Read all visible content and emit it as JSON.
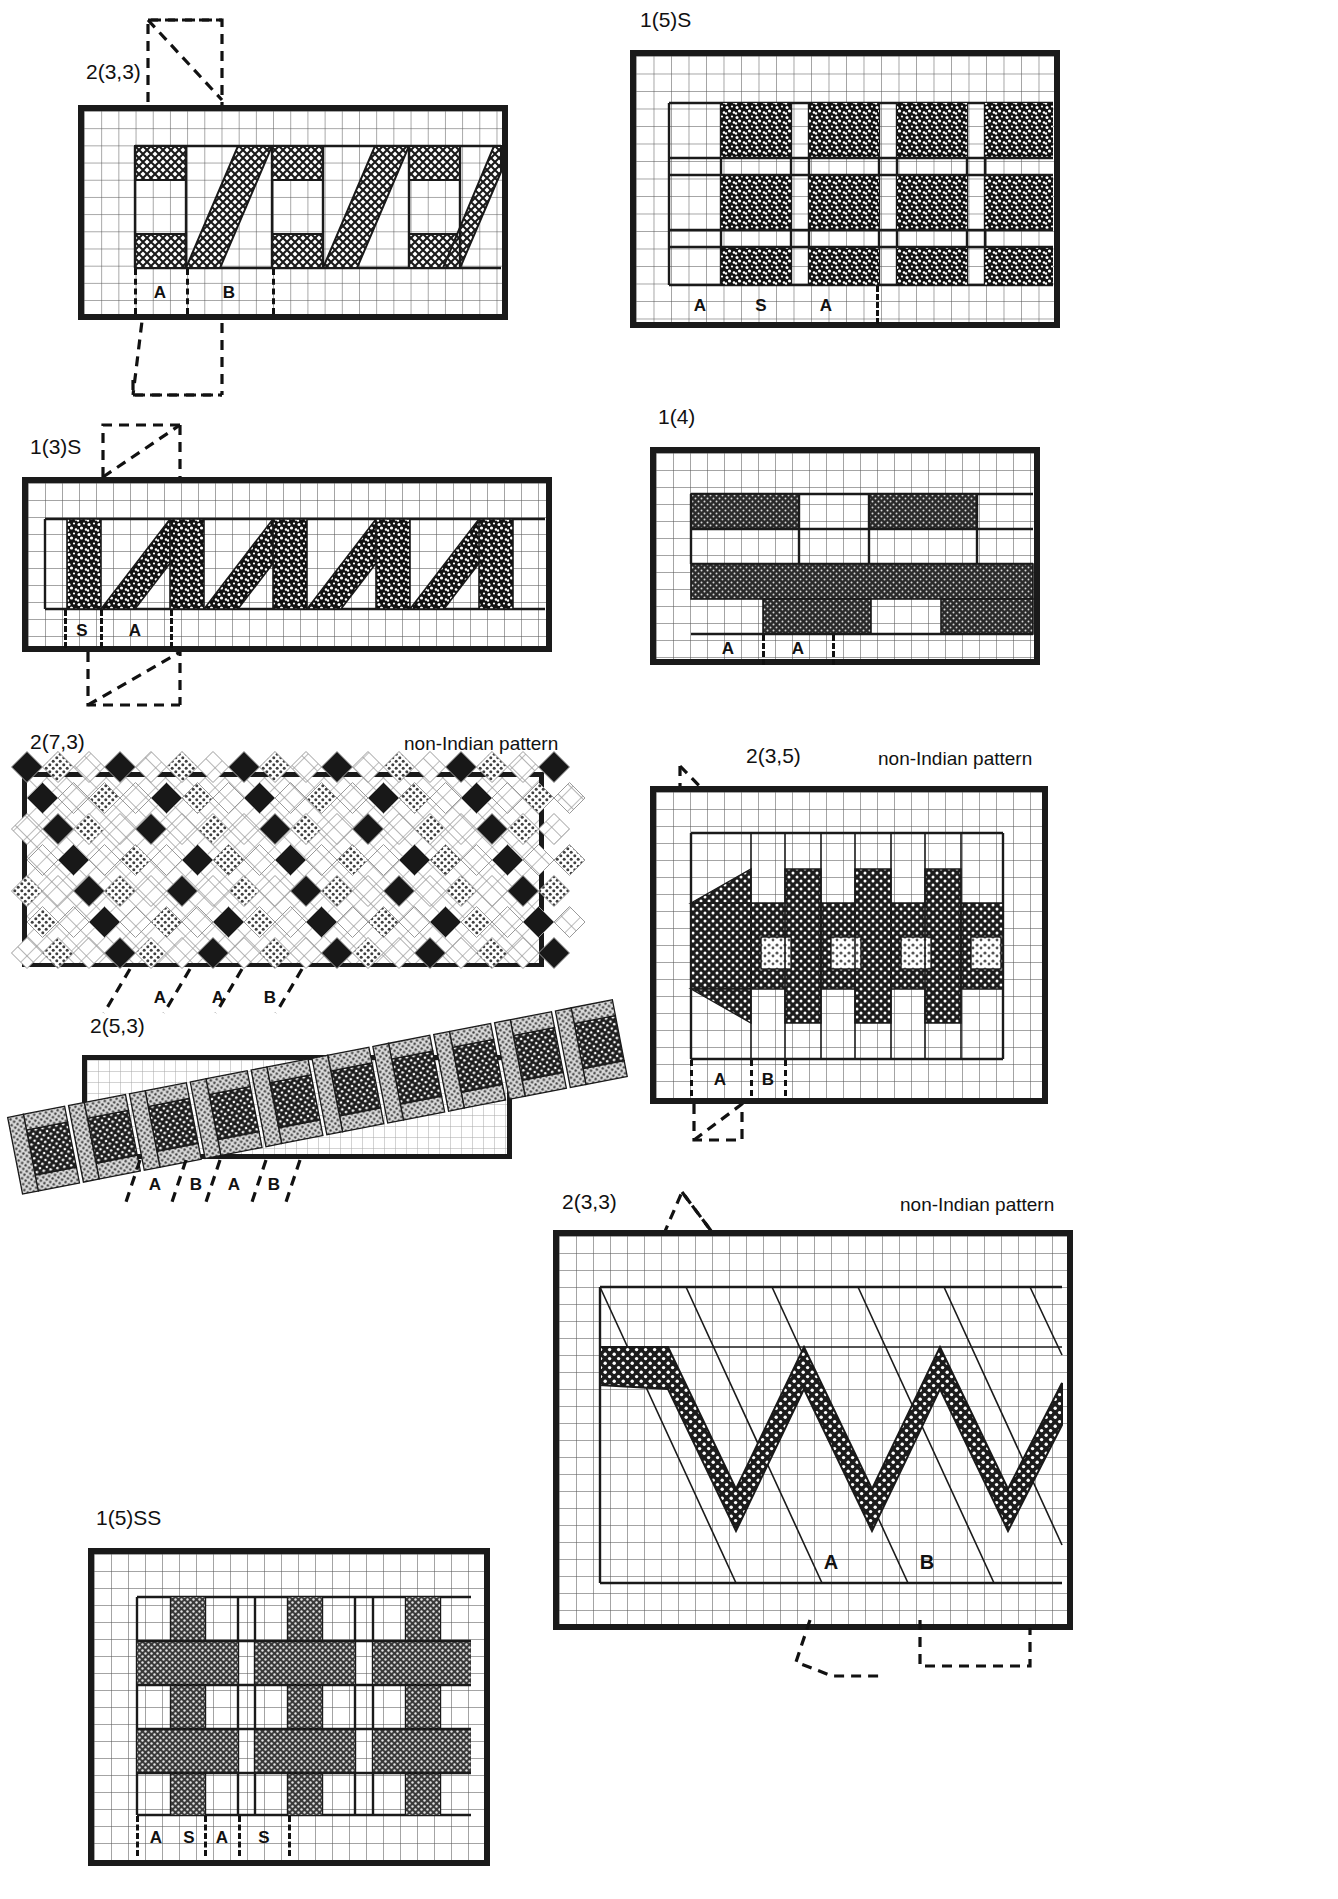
{
  "page": {
    "width": 1338,
    "height": 1899,
    "background": "#ffffff",
    "ink": "#1a1a1a",
    "gridline": "#5a5a5a"
  },
  "annotations": {
    "non_indian": "non-Indian pattern"
  },
  "panels": [
    {
      "id": "p1",
      "caption": "2(3,3)",
      "fill_style": "cross-hatch",
      "repeat_labels": [
        "A",
        "B"
      ],
      "non_indian": false,
      "frame": {
        "x": 78,
        "y": 105,
        "w": 430,
        "h": 215
      },
      "caption_pos": {
        "x": 86,
        "y": 72
      },
      "grid_cell": 17.2,
      "motif": "stepped diagonal twill with cross-hatched blocks",
      "overlay": "diagonal dashed cutting-plane through top-left and bottom"
    },
    {
      "id": "p2",
      "caption": "1(5)S",
      "fill_style": "coarse-speckle",
      "repeat_labels": [
        "A",
        "S",
        "A"
      ],
      "non_indian": false,
      "frame": {
        "x": 630,
        "y": 50,
        "w": 430,
        "h": 278
      },
      "caption_pos": {
        "x": 640,
        "y": 20
      },
      "grid_cell": 17.5,
      "motif": "three rows of speckled blocks separated by plain channels"
    },
    {
      "id": "p3",
      "caption": "1(3)S",
      "fill_style": "coarse-speckle",
      "repeat_labels": [
        "S",
        "A"
      ],
      "non_indian": false,
      "frame": {
        "x": 22,
        "y": 477,
        "w": 530,
        "h": 175
      },
      "caption_pos": {
        "x": 30,
        "y": 447
      },
      "grid_cell": 17.0,
      "motif": "running zig-zag / lightning stripe",
      "overlay": "vertical dashed cutting-plane at left"
    },
    {
      "id": "p4",
      "caption": "1(4)",
      "fill_style": "dense-dot",
      "repeat_labels": [
        "A",
        "A"
      ],
      "non_indian": false,
      "frame": {
        "x": 650,
        "y": 447,
        "w": 390,
        "h": 218
      },
      "caption_pos": {
        "x": 658,
        "y": 417
      },
      "grid_cell": 17.0,
      "motif": "broken horizontal bars with a continuous centre band"
    },
    {
      "id": "p5",
      "caption": "2(7,3)",
      "fill_style": "diamond-lattice",
      "repeat_labels": [
        "A",
        "A",
        "B"
      ],
      "non_indian": true,
      "frame": {
        "x": 22,
        "y": 772,
        "w": 522,
        "h": 195
      },
      "caption_pos": {
        "x": 30,
        "y": 742
      },
      "grid_cell": 17.0,
      "motif": "argyle-like lattice of black, grey and white diamonds"
    },
    {
      "id": "p6",
      "caption": "2(3,5)",
      "fill_style": "dotted-dark",
      "repeat_labels": [
        "A",
        "B"
      ],
      "non_indian": true,
      "frame": {
        "x": 650,
        "y": 786,
        "w": 398,
        "h": 318
      },
      "caption_pos": {
        "x": 746,
        "y": 756
      },
      "grid_cell": 17.0,
      "motif": "interlocking stepped parallelograms with light speckled insets",
      "overlay": "dashed cutting-planes top-left and bottom-left"
    },
    {
      "id": "p7",
      "caption": "2(5,3)",
      "fill_style": "mixed-dot",
      "repeat_labels": [
        "A",
        "B",
        "A",
        "B"
      ],
      "non_indian": false,
      "frame": {
        "x": 82,
        "y": 1055,
        "w": 430,
        "h": 104
      },
      "caption_pos": {
        "x": 90,
        "y": 1026
      },
      "grid_cell": 16.0,
      "motif": "oblique plaited bands of dark and light dotted blocks"
    },
    {
      "id": "p8",
      "caption": "1(5)SS",
      "fill_style": "mid-dot",
      "repeat_labels": [
        "A",
        "S",
        "A",
        "S"
      ],
      "non_indian": false,
      "frame": {
        "x": 88,
        "y": 1548,
        "w": 402,
        "h": 318
      },
      "caption_pos": {
        "x": 96,
        "y": 1518
      },
      "grid_cell": 17.0,
      "motif": "grid of dotted crosses / plus-shaped blocks"
    },
    {
      "id": "p9",
      "caption": "2(3,3)",
      "fill_style": "dotted-dark",
      "repeat_labels": [
        "A",
        "B"
      ],
      "non_indian": true,
      "frame": {
        "x": 553,
        "y": 1230,
        "w": 520,
        "h": 400
      },
      "caption_pos": {
        "x": 562,
        "y": 1202
      },
      "grid_cell": 17.0,
      "motif": "wide dotted zig-zag chevron band over a ruled lattice",
      "overlay": "dashed arrows tracing the repeat at top and bottom"
    }
  ]
}
